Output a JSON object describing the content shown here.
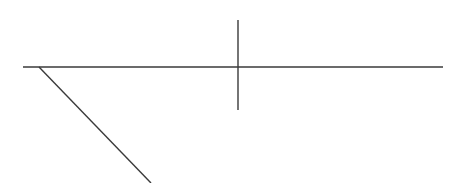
{
  "diagram": {
    "type": "line-drawing",
    "background": "#ffffff",
    "stroke_color": "#3a3a3a",
    "stroke_width": 1.4,
    "lines": [
      {
        "name": "horizontal-line",
        "x1": 23,
        "y1": 67,
        "x2": 443,
        "y2": 67
      },
      {
        "name": "vertical-line",
        "x1": 238,
        "y1": 20,
        "x2": 238,
        "y2": 110
      },
      {
        "name": "diagonal-line",
        "x1": 39,
        "y1": 67,
        "x2": 151,
        "y2": 183
      }
    ]
  }
}
